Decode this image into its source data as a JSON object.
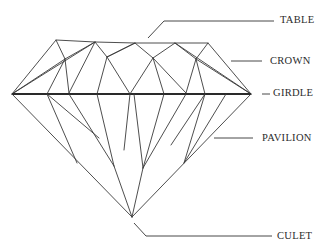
{
  "diagram": {
    "labels": {
      "table": "TABLE",
      "crown": "CROWN",
      "girdle": "GIRDLE",
      "pavilion": "PAVILION",
      "culet": "CULET"
    },
    "colors": {
      "line": "#3a3a3a",
      "text": "#2b2b2b",
      "background": "#ffffff"
    }
  }
}
